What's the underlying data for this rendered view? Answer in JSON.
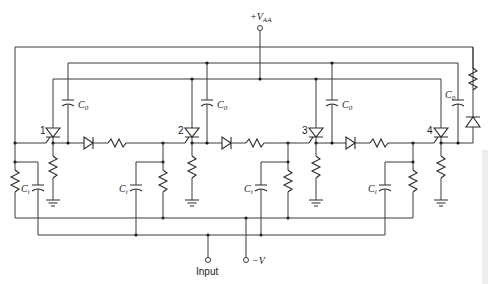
{
  "diagram": {
    "supply_label": {
      "main": "+V",
      "sub": "AA"
    },
    "input_label": "Input",
    "neg_supply_label": "−V",
    "scr_labels": [
      "1",
      "2",
      "3",
      "4"
    ],
    "commutating_cap_label": {
      "main": "C",
      "sub": "0"
    },
    "input_cap_label": {
      "main": "C",
      "sub": "i"
    },
    "stages": [
      {
        "id": "1",
        "scr_x": 53,
        "c0_x": 68
      },
      {
        "id": "2",
        "scr_x": 192,
        "c0_x": 207
      },
      {
        "id": "3",
        "scr_x": 316,
        "c0_x": 332
      },
      {
        "id": "4",
        "scr_x": 441,
        "c0_x": 458
      }
    ],
    "colors": {
      "line": "#3a3a3a",
      "background": "#ffffff"
    }
  }
}
